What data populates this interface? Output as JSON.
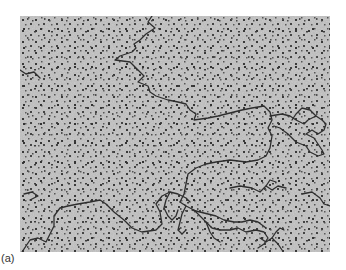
{
  "figure": {
    "panel_label": "(a)",
    "colors": {
      "background": "#b9b9b9",
      "strand": "#2e2e2e",
      "speckle": "#3a3a3a"
    }
  }
}
